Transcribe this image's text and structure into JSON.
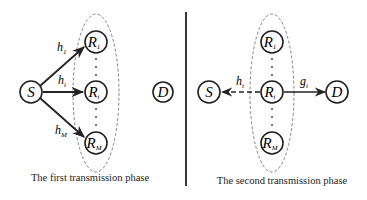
{
  "colors": {
    "ink": "#222222",
    "ellipse": "#666666",
    "background": "#ffffff"
  },
  "panels": [
    {
      "id": "first-phase",
      "caption": "The first transmission phase",
      "nodes": {
        "source": {
          "label": "S"
        },
        "relay_1": {
          "label": "R",
          "sub": "1"
        },
        "relay_i": {
          "label": "R",
          "sub": "i"
        },
        "relay_M": {
          "label": "R",
          "sub": "M"
        },
        "destination": {
          "label": "D"
        }
      },
      "edges": {
        "h1": {
          "label": "h",
          "sub": "1",
          "from": "S",
          "to": "R1",
          "style": "solid-arrow"
        },
        "hi": {
          "label": "h",
          "sub": "i",
          "from": "S",
          "to": "Ri",
          "style": "solid-arrow"
        },
        "hM": {
          "label": "h",
          "sub": "M",
          "from": "S",
          "to": "RM",
          "style": "solid-arrow"
        }
      },
      "dots": "⋮"
    },
    {
      "id": "second-phase",
      "caption": "The second transmission phase",
      "nodes": {
        "source": {
          "label": "S"
        },
        "relay_1": {
          "label": "R",
          "sub": "1"
        },
        "relay_i": {
          "label": "R",
          "sub": "i"
        },
        "relay_M": {
          "label": "R",
          "sub": "M"
        },
        "destination": {
          "label": "D"
        }
      },
      "edges": {
        "hi": {
          "label": "h",
          "sub": "i",
          "from": "Ri",
          "to": "S",
          "style": "dashed-arrow"
        },
        "gi": {
          "label": "g",
          "sub": "i",
          "from": "Ri",
          "to": "D",
          "style": "solid-arrow"
        }
      },
      "dots": "⋮"
    }
  ]
}
